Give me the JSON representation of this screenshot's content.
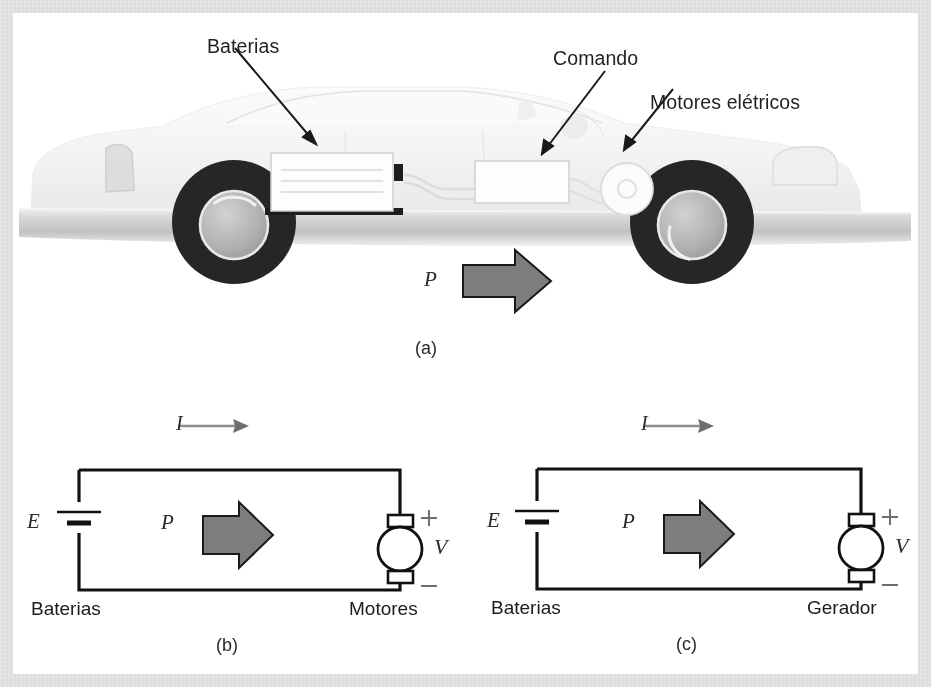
{
  "figure": {
    "panels": [
      {
        "id": "a",
        "caption": "(a)"
      },
      {
        "id": "b",
        "caption": "(b)"
      },
      {
        "id": "c",
        "caption": "(c)"
      }
    ]
  },
  "panel_a": {
    "caption": "(a)",
    "callouts": [
      {
        "name": "baterias",
        "label": "Baterias"
      },
      {
        "name": "comando",
        "label": "Comando"
      },
      {
        "name": "motores-eletricos",
        "label": "Motores elétricos"
      }
    ],
    "power_symbol": "P",
    "colors": {
      "car_body": "#f2f2f2",
      "tire": "#262626",
      "rim": "#b3b3b3",
      "road": "#cfcfcf",
      "arrow_fill": "#7d7d7d",
      "arrow_stroke": "#1a1a1a"
    }
  },
  "panel_b": {
    "caption": "(b)",
    "current_symbol": "I",
    "power_symbol": "P",
    "emf_symbol": "E",
    "voltage_symbol": "V",
    "plus_sign": "+",
    "minus_sign": "–",
    "source_label": "Baterias",
    "load_label": "Motores"
  },
  "panel_c": {
    "caption": "(c)",
    "current_symbol": "I",
    "power_symbol": "P",
    "emf_symbol": "E",
    "voltage_symbol": "V",
    "plus_sign": "+",
    "minus_sign": "–",
    "source_label": "Baterias",
    "load_label": "Gerador"
  }
}
